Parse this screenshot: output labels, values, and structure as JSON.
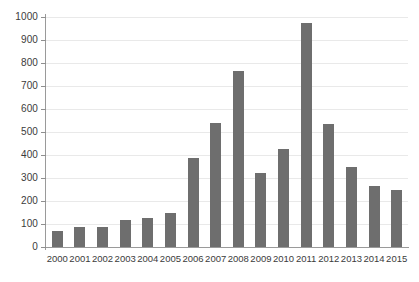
{
  "chart_data": {
    "type": "bar",
    "title": "",
    "subtitle": "",
    "xlabel": "",
    "ylabel": "",
    "categories": [
      "2000",
      "2001",
      "2002",
      "2003",
      "2004",
      "2005",
      "2006",
      "2007",
      "2008",
      "2009",
      "2010",
      "2011",
      "2012",
      "2013",
      "2014",
      "2015"
    ],
    "values": [
      70,
      85,
      88,
      118,
      127,
      148,
      388,
      539,
      765,
      322,
      428,
      972,
      535,
      348,
      265,
      248
    ],
    "series": [
      {
        "name": "",
        "values": [
          70,
          85,
          88,
          118,
          127,
          148,
          388,
          539,
          765,
          322,
          428,
          972,
          535,
          348,
          265,
          248
        ]
      }
    ],
    "ylim": [
      0,
      1000
    ],
    "ytick_labels": [
      "0",
      "100",
      "200",
      "300",
      "400",
      "500",
      "600",
      "700",
      "800",
      "900",
      "1000"
    ],
    "ytick_values": [
      0,
      100,
      200,
      300,
      400,
      500,
      600,
      700,
      800,
      900,
      1000
    ],
    "xtick_labels": [
      "2000",
      "2001",
      "2002",
      "2003",
      "2004",
      "2005",
      "2006",
      "2007",
      "2008",
      "2009",
      "2010",
      "2011",
      "2012",
      "2013",
      "2014",
      "2015"
    ],
    "grid": true,
    "grid_axis": "y",
    "legend": false,
    "legend_position": "none",
    "annotations": [],
    "colors": {
      "bar": "#6e6e6e",
      "gridline": "#e9e9e9",
      "axis": "#9a9a9a",
      "text": "#3b3b3b",
      "background": "#ffffff"
    }
  }
}
